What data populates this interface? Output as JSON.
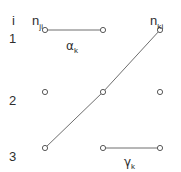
{
  "figure": {
    "width": 181,
    "height": 172,
    "background": "#ffffff",
    "stroke_color": "#6e6e6e",
    "node_stroke_color": "#5a5a5a",
    "node_fill": "#ffffff",
    "text_color": "#2e2e2e"
  },
  "axis": {
    "index_label": "i",
    "index_label_x": 12,
    "index_label_y": 14
  },
  "column_headers": [
    {
      "id": "n-ji",
      "base": "n",
      "subscript": "ji",
      "x": 32,
      "y": 14
    },
    {
      "id": "n-ki",
      "base": "n",
      "subscript": "ki",
      "x": 150,
      "y": 14
    }
  ],
  "row_labels": [
    {
      "id": "row-1",
      "text": "1",
      "x": 9,
      "y": 32
    },
    {
      "id": "row-2",
      "text": "2",
      "x": 9,
      "y": 94
    },
    {
      "id": "row-3",
      "text": "3",
      "x": 9,
      "y": 150
    }
  ],
  "nodes": [
    {
      "id": "node-r1c1",
      "row": 1,
      "col": 1,
      "cx": 45,
      "cy": 30,
      "r": 2.6
    },
    {
      "id": "node-r1c2",
      "row": 1,
      "col": 2,
      "cx": 103,
      "cy": 30,
      "r": 2.6
    },
    {
      "id": "node-r1c3",
      "row": 1,
      "col": 3,
      "cx": 160,
      "cy": 30,
      "r": 2.6
    },
    {
      "id": "node-r2c1",
      "row": 2,
      "col": 1,
      "cx": 45,
      "cy": 92,
      "r": 2.6
    },
    {
      "id": "node-r2c2",
      "row": 2,
      "col": 2,
      "cx": 103,
      "cy": 92,
      "r": 2.6
    },
    {
      "id": "node-r2c3",
      "row": 2,
      "col": 3,
      "cx": 160,
      "cy": 92,
      "r": 2.6
    },
    {
      "id": "node-r3c1",
      "row": 3,
      "col": 1,
      "cx": 45,
      "cy": 148,
      "r": 2.6
    },
    {
      "id": "node-r3c2",
      "row": 3,
      "col": 2,
      "cx": 103,
      "cy": 148,
      "r": 2.6
    },
    {
      "id": "node-r3c3",
      "row": 3,
      "col": 3,
      "cx": 160,
      "cy": 148,
      "r": 2.6
    }
  ],
  "edges": [
    {
      "id": "edge-alpha",
      "x1": 45,
      "y1": 30,
      "x2": 103,
      "y2": 30
    },
    {
      "id": "edge-diagonal-lower",
      "x1": 45,
      "y1": 148,
      "x2": 103,
      "y2": 92
    },
    {
      "id": "edge-diagonal-upper",
      "x1": 103,
      "y1": 92,
      "x2": 160,
      "y2": 30
    },
    {
      "id": "edge-gamma",
      "x1": 103,
      "y1": 148,
      "x2": 160,
      "y2": 148
    }
  ],
  "edge_labels": [
    {
      "id": "alpha-k",
      "base": "α",
      "subscript": "k",
      "x": 66,
      "y": 40
    },
    {
      "id": "gamma-k",
      "base": "γ",
      "subscript": "k",
      "x": 124,
      "y": 156
    }
  ],
  "chart_data": {
    "type": "scatter",
    "title": "",
    "xlabel": "",
    "ylabel": "i",
    "grid": false,
    "legend": null,
    "categories": [
      "n_ji",
      "(middle)",
      "n_ki"
    ],
    "x_tick_labels": [
      "n_ji",
      "",
      "n_ki"
    ],
    "y_tick_labels": [
      "1",
      "2",
      "3"
    ],
    "series": [
      {
        "name": "nodes",
        "points": [
          {
            "x": 1,
            "y": 1
          },
          {
            "x": 2,
            "y": 1
          },
          {
            "x": 3,
            "y": 1
          },
          {
            "x": 1,
            "y": 2
          },
          {
            "x": 2,
            "y": 2
          },
          {
            "x": 3,
            "y": 2
          },
          {
            "x": 1,
            "y": 3
          },
          {
            "x": 2,
            "y": 3
          },
          {
            "x": 3,
            "y": 3
          }
        ]
      }
    ],
    "connections": [
      {
        "label": "α_k",
        "from": {
          "x": 1,
          "y": 1
        },
        "to": {
          "x": 2,
          "y": 1
        }
      },
      {
        "label": "",
        "from": {
          "x": 1,
          "y": 3
        },
        "to": {
          "x": 3,
          "y": 1
        },
        "via": {
          "x": 2,
          "y": 2
        }
      },
      {
        "label": "γ_k",
        "from": {
          "x": 2,
          "y": 3
        },
        "to": {
          "x": 3,
          "y": 3
        }
      }
    ],
    "annotations": [
      "i",
      "n_ji",
      "n_ki",
      "α_k",
      "γ_k",
      "1",
      "2",
      "3"
    ]
  }
}
